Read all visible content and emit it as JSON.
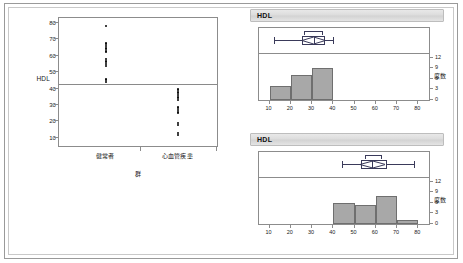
{
  "oneway": {
    "y_axis_label": "HDL",
    "x_axis_label": "群",
    "y_ticks": [
      10,
      20,
      30,
      40,
      50,
      60,
      70,
      80
    ],
    "y_min": 5,
    "y_max": 83,
    "group_labels": [
      "健常者",
      "心血管疾患"
    ],
    "mean_line_value": 42.5,
    "points": {
      "healthy": [
        78,
        68,
        67,
        66,
        65,
        64,
        63,
        62,
        58,
        57,
        56,
        55,
        54,
        46,
        45,
        44
      ],
      "cvd": [
        40,
        39,
        38,
        37,
        36,
        35,
        34,
        33,
        29,
        28,
        27,
        26,
        25,
        19,
        18,
        13,
        12
      ]
    }
  },
  "panels": [
    {
      "title": "HDL",
      "x_ticks": [
        10,
        20,
        30,
        40,
        50,
        60,
        70,
        80
      ],
      "x_min": 5,
      "x_max": 85,
      "y_ticks": [
        0,
        3,
        6,
        9,
        12
      ],
      "y_min": 0,
      "y_max": 13,
      "y_axis_label": "度数",
      "boxplot": {
        "min": 12,
        "q1": 25,
        "median": 31,
        "q3": 36,
        "max": 40,
        "mean": 30.5,
        "ci_low": 26,
        "ci_high": 35
      },
      "histogram": {
        "bins": [
          {
            "from": 10,
            "to": 20,
            "count": 4
          },
          {
            "from": 20,
            "to": 30,
            "count": 7
          },
          {
            "from": 30,
            "to": 40,
            "count": 9
          }
        ]
      }
    },
    {
      "title": "HDL",
      "x_ticks": [
        10,
        20,
        30,
        40,
        50,
        60,
        70,
        80
      ],
      "x_min": 5,
      "x_max": 85,
      "y_ticks": [
        0,
        3,
        6,
        9,
        12
      ],
      "y_min": 0,
      "y_max": 13,
      "y_axis_label": "度数",
      "boxplot": {
        "min": 44,
        "q1": 53,
        "median": 58,
        "q3": 65,
        "max": 78,
        "mean": 58.5,
        "ci_low": 55,
        "ci_high": 63
      },
      "histogram": {
        "bins": [
          {
            "from": 40,
            "to": 50,
            "count": 6
          },
          {
            "from": 50,
            "to": 60,
            "count": 5.5
          },
          {
            "from": 60,
            "to": 70,
            "count": 8
          },
          {
            "from": 70,
            "to": 80,
            "count": 1
          }
        ]
      }
    }
  ],
  "colors": {
    "bar_fill": "#a8a8a8",
    "bar_stroke": "#6f6f6f",
    "axis": "#8c8c8c",
    "point": "#000000",
    "box_stroke": "#3a3a5a"
  }
}
